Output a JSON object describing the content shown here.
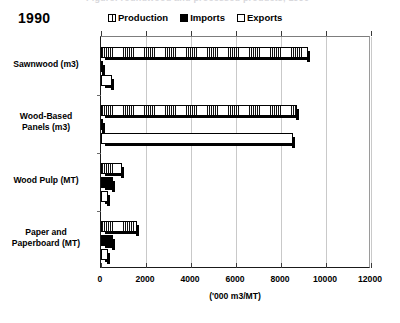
{
  "top_caption": "Figure: roundwood and processed products, 1990",
  "year": "1990",
  "legend": [
    {
      "label": "Production",
      "swatch": "hatched-white",
      "color": "#ffffff"
    },
    {
      "label": "Imports",
      "swatch": "solid-black",
      "color": "#000000"
    },
    {
      "label": "Exports",
      "swatch": "open-white",
      "color": "#ffffff"
    }
  ],
  "chart_data": {
    "type": "bar",
    "orientation": "horizontal",
    "title": "1990",
    "xlabel": "('000 m3/MT)",
    "ylabel": "",
    "xlim": [
      0,
      12000
    ],
    "xticks": [
      0,
      2000,
      4000,
      6000,
      8000,
      10000,
      12000
    ],
    "xtick_labels": [
      "0",
      "2000",
      "4000",
      "6000",
      "8000",
      "10000",
      "12000"
    ],
    "grid": "vertical",
    "legend_position": "top",
    "categories": [
      "Sawnwood (m3)",
      "Wood-Based Panels (m3)",
      "Wood Pulp (MT)",
      "Paper and Paperboard (MT)"
    ],
    "series": [
      {
        "name": "Production",
        "values": [
          9200,
          8700,
          930,
          1620
        ]
      },
      {
        "name": "Imports",
        "values": [
          60,
          70,
          520,
          540
        ]
      },
      {
        "name": "Exports",
        "values": [
          500,
          8550,
          330,
          290
        ]
      }
    ]
  }
}
